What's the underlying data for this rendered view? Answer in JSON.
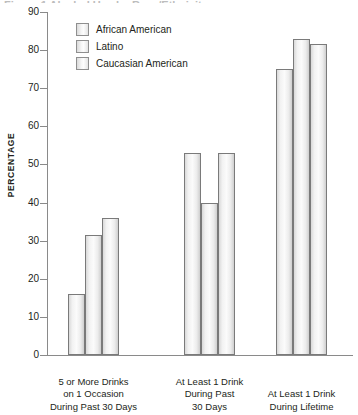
{
  "title_sliver": "Figure 1  Alcohol Use by Race/Ethnicity",
  "chart_data": {
    "type": "bar",
    "title": "",
    "xlabel": "",
    "ylabel": "PERCENTAGE",
    "ylim": [
      0,
      90
    ],
    "yticks": [
      0,
      10,
      20,
      30,
      40,
      50,
      60,
      70,
      80,
      90
    ],
    "grid": false,
    "legend_position": "top-left",
    "categories": [
      "5 or More Drinks on 1 Occasion During Past 30 Days",
      "At Least 1 Drink During Past 30 Days",
      "At Least 1 Drink During Lifetime"
    ],
    "category_lines": [
      [
        "5 or More Drinks",
        "on 1 Occasion",
        "During Past 30 Days"
      ],
      [
        "At Least 1 Drink",
        "During Past",
        "30 Days"
      ],
      [
        "At Least 1 Drink",
        "During Lifetime",
        ""
      ]
    ],
    "series": [
      {
        "name": "African American",
        "values": [
          16,
          53,
          75
        ]
      },
      {
        "name": "Latino",
        "values": [
          31.5,
          40,
          83
        ]
      },
      {
        "name": "Caucasian American",
        "values": [
          36,
          53,
          81.5
        ]
      }
    ]
  },
  "colors": {
    "axis": "#8a8a8a",
    "bar_border": "#7a7a7a",
    "text": "#231f20",
    "background": "#ffffff"
  }
}
